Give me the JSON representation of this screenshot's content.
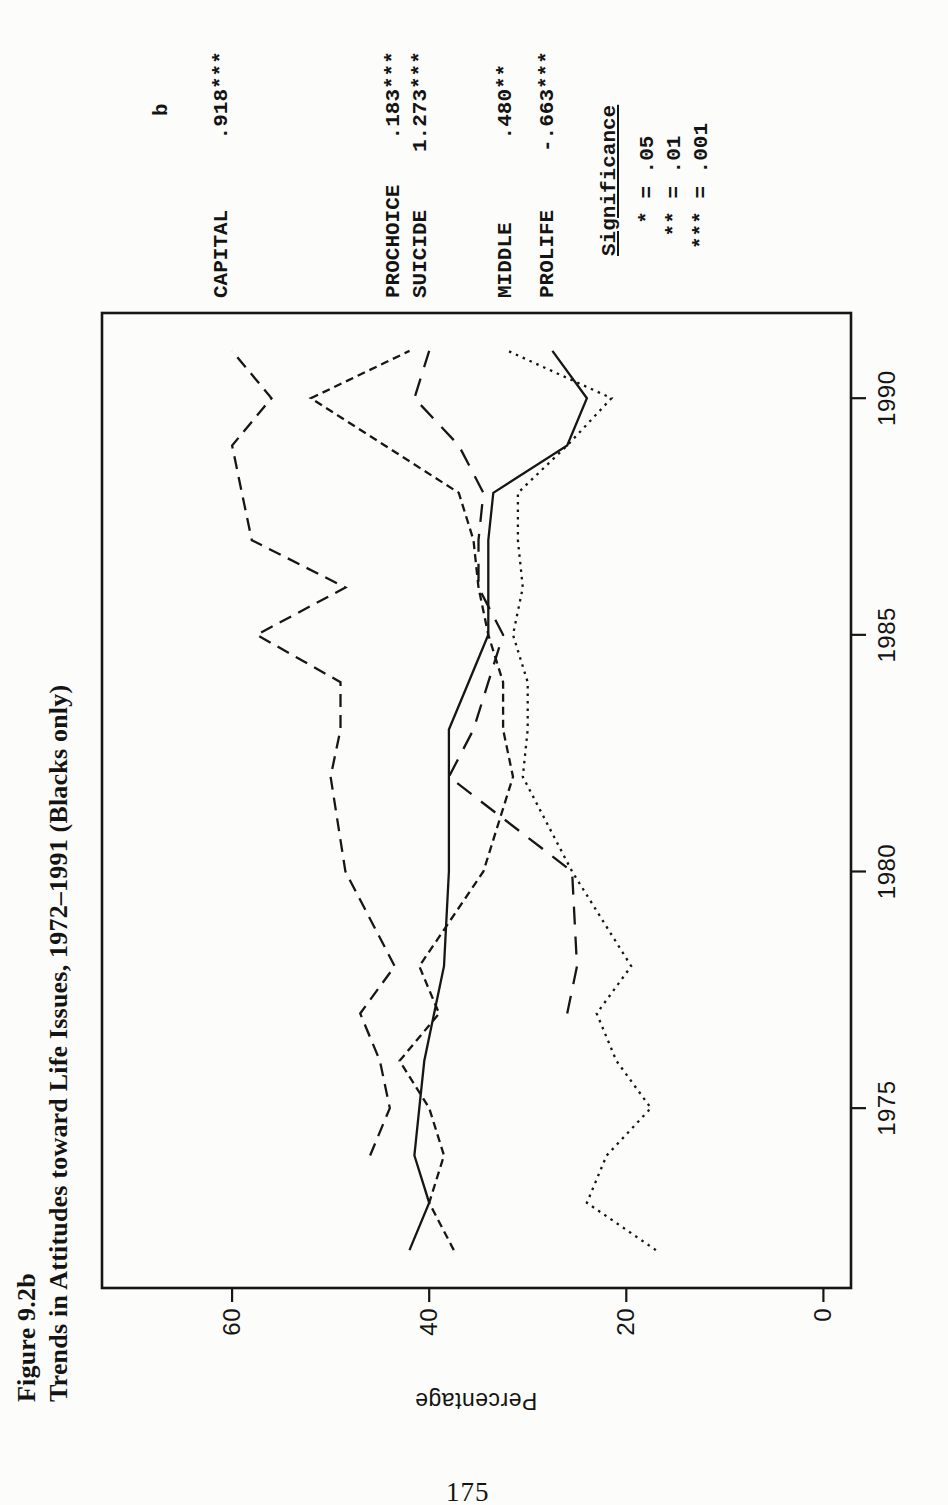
{
  "figure": {
    "label": "Figure 9.2b",
    "title": "Trends in Attitudes toward Life Issues, 1972–1991 (Blacks only)"
  },
  "legend": {
    "b_header": "b",
    "significance": {
      "title": "Significance",
      "entries": [
        "  * = .05",
        " ** = .01",
        "*** = .001"
      ]
    }
  },
  "page_number": "175",
  "colors": {
    "ink": "#161616",
    "paper": "#fcfcfa"
  },
  "chart_data": {
    "type": "line",
    "title": "Figure 9.2b",
    "subtitle": "Trends in Attitudes toward Life Issues, 1972–1991 (Blacks only)",
    "xlabel": "",
    "ylabel": "Percentage",
    "x_ticks": [
      1975,
      1980,
      1985,
      1990
    ],
    "y_ticks": [
      0,
      20,
      40,
      60
    ],
    "xlim": [
      1971.2,
      1991.8
    ],
    "ylim": [
      -2.8,
      73.2
    ],
    "grid": false,
    "legend_position": "right-margin, rows aligned to line endpoints",
    "orientation": "figure printed rotated 90 degrees counterclockwise on portrait page",
    "x": [
      1972,
      1973,
      1974,
      1975,
      1976,
      1977,
      1978,
      1980,
      1982,
      1983,
      1984,
      1985,
      1986,
      1987,
      1988,
      1989,
      1990,
      1991
    ],
    "series": [
      {
        "name": "CAPITAL",
        "b": " .918***",
        "style": "dash-long",
        "values": [
          null,
          null,
          46,
          44,
          45,
          47,
          43.5,
          48.5,
          50,
          49,
          49,
          57.5,
          48.5,
          58,
          59,
          60,
          56,
          60
        ]
      },
      {
        "name": "PROCHOICE",
        "b": " .183***",
        "style": "dash-short",
        "values": [
          37.5,
          40,
          38.5,
          40,
          43,
          39,
          41,
          34.5,
          31.5,
          32.5,
          32.5,
          34,
          35,
          35.5,
          37,
          44.5,
          52,
          42
        ]
      },
      {
        "name": "SUICIDE",
        "b": "1.273***",
        "style": "dash-xlong",
        "values": [
          null,
          null,
          null,
          null,
          null,
          26,
          25,
          25.5,
          38,
          35.5,
          34,
          32.5,
          35,
          35,
          34.5,
          37,
          41.5,
          40
        ]
      },
      {
        "name": "MIDDLE",
        "b": " .480**",
        "style": "dotted",
        "values": [
          17,
          24,
          22,
          17.5,
          21,
          23,
          19.5,
          25.5,
          30.5,
          30,
          30,
          31.5,
          30.5,
          31,
          31,
          26,
          21.5,
          32
        ]
      },
      {
        "name": "PROLIFE",
        "b": "-.663***",
        "style": "solid",
        "values": [
          42,
          40,
          41.5,
          41,
          40.5,
          39.5,
          38.5,
          38,
          38,
          38,
          36,
          34,
          34,
          34,
          33.5,
          26,
          24,
          27.5
        ]
      }
    ]
  }
}
